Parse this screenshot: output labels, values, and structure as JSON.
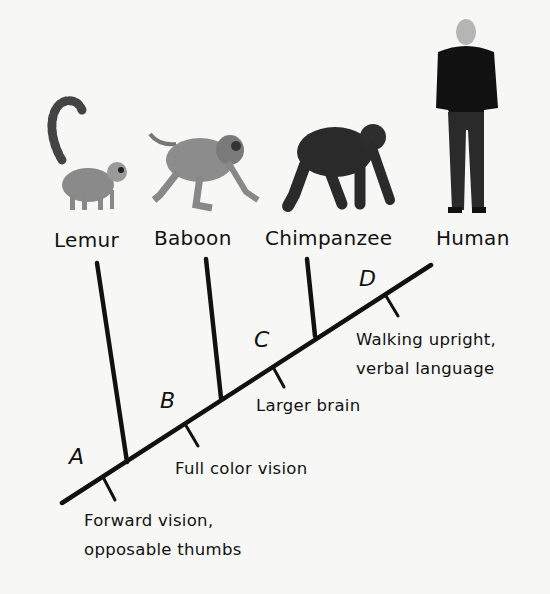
{
  "diagram": {
    "type": "cladogram",
    "background_color": "#f7f7f6",
    "line_color": "#111111",
    "taxa": [
      {
        "name": "Lemur",
        "icon": "lemur-icon"
      },
      {
        "name": "Baboon",
        "icon": "baboon-icon"
      },
      {
        "name": "Chimpanzee",
        "icon": "chimpanzee-icon"
      },
      {
        "name": "Human",
        "icon": "human-icon"
      }
    ],
    "nodes": [
      {
        "label": "A",
        "trait_line1": "Forward vision,",
        "trait_line2": "opposable thumbs"
      },
      {
        "label": "B",
        "trait_line1": "Full color vision",
        "trait_line2": ""
      },
      {
        "label": "C",
        "trait_line1": "Larger brain",
        "trait_line2": ""
      },
      {
        "label": "D",
        "trait_line1": "Walking upright,",
        "trait_line2": "verbal language"
      }
    ]
  }
}
